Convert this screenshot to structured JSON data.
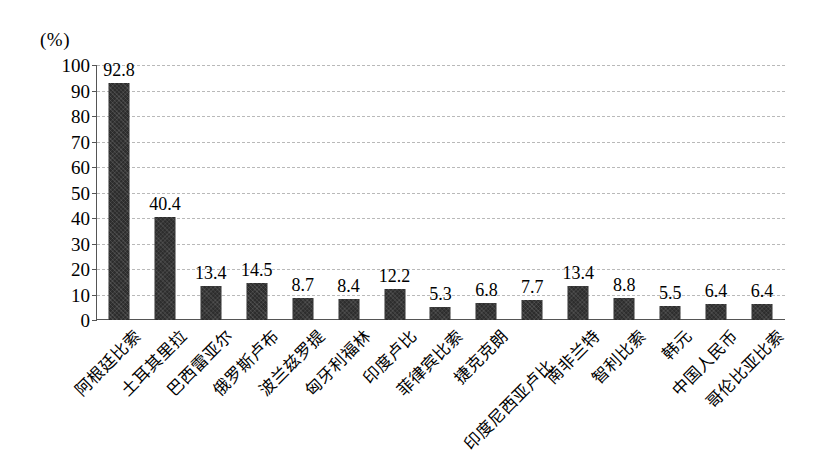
{
  "chart_data": {
    "type": "bar",
    "title": "",
    "subtitle": "",
    "xlabel": "",
    "ylabel": "",
    "unit_label": "(%)",
    "ylim": [
      0,
      100
    ],
    "ytick_step": 10,
    "yticks": [
      "100",
      "90",
      "80",
      "70",
      "60",
      "50",
      "40",
      "30",
      "20",
      "10",
      "0"
    ],
    "grid": true,
    "grid_orientation": "horizontal",
    "legend": null,
    "bar_color": "#2d2d2d",
    "categories": [
      "阿根廷比索",
      "土耳其里拉",
      "巴西雷亚尔",
      "俄罗斯卢布",
      "波兰兹罗提",
      "匈牙利福林",
      "印度卢比",
      "菲律宾比索",
      "捷克克朗",
      "印度尼西亚卢比",
      "南非兰特",
      "智利比索",
      "韩元",
      "中国人民币",
      "哥伦比亚比索"
    ],
    "values": [
      92.8,
      40.4,
      13.4,
      14.5,
      8.7,
      8.4,
      12.2,
      5.3,
      6.8,
      7.7,
      13.4,
      8.8,
      5.5,
      6.4,
      6.4
    ],
    "value_labels": [
      "92.8",
      "40.4",
      "13.4",
      "14.5",
      "8.7",
      "8.4",
      "12.2",
      "5.3",
      "6.8",
      "7.7",
      "13.4",
      "8.8",
      "5.5",
      "6.4",
      "6.4"
    ]
  }
}
